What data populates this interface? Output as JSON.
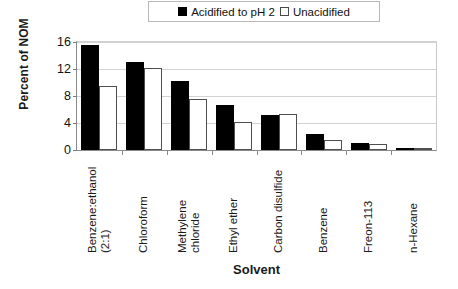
{
  "chart_data": {
    "type": "bar",
    "title": "",
    "xlabel": "Solvent",
    "ylabel": "Percent of NOM",
    "ylim": [
      0,
      16
    ],
    "yticks": [
      0,
      4,
      8,
      12,
      16
    ],
    "grid": true,
    "legend_position": "top",
    "categories": [
      "Benzene:ethanol\n(2:1)",
      "Chloroform",
      "Methylene\nchloride",
      "Ethyl ether",
      "Carbon disulfide",
      "Benzene",
      "Freon-113",
      "n-Hexane"
    ],
    "series": [
      {
        "name": "Acidified to pH 2",
        "color": "#000000",
        "values": [
          15.6,
          13.0,
          10.2,
          6.6,
          5.2,
          2.3,
          1.1,
          0.3
        ]
      },
      {
        "name": "Unacidified",
        "color": "#ffffff",
        "values": [
          9.5,
          12.1,
          7.5,
          4.1,
          5.4,
          1.5,
          0.9,
          0.2
        ]
      }
    ]
  },
  "legend": {
    "entries": [
      {
        "label": "Acidified to pH 2",
        "swatch": "filled-square"
      },
      {
        "label": "Unacidified",
        "swatch": "hollow-square"
      }
    ]
  },
  "axes": {
    "y_title": "Percent of NOM",
    "x_title": "Solvent",
    "y_tick_labels": [
      "16",
      "12",
      "8",
      "4",
      "0"
    ]
  }
}
